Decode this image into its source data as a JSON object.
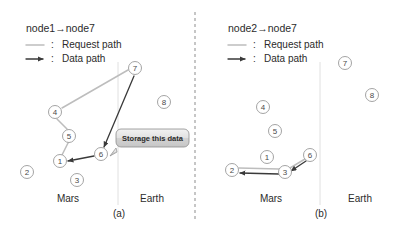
{
  "figure": {
    "caption_a": "(a)",
    "caption_b": "(b)"
  },
  "panel_a": {
    "title": "node1→node7",
    "legend": [
      {
        "colon": ":",
        "label": "Request path",
        "kind": "request",
        "color": "#bdbdbd"
      },
      {
        "colon": ":",
        "label": "Data path",
        "kind": "data",
        "color": "#3a3a3a"
      }
    ],
    "regions": {
      "left": "Mars",
      "right": "Earth"
    },
    "nodes": [
      {
        "id": "n7",
        "label": "7",
        "x": 135,
        "y": 68
      },
      {
        "id": "n8",
        "label": "8",
        "x": 164,
        "y": 102
      },
      {
        "id": "n4",
        "label": "4",
        "x": 55,
        "y": 112
      },
      {
        "id": "n5",
        "label": "5",
        "x": 69,
        "y": 136
      },
      {
        "id": "n6",
        "label": "6",
        "x": 101,
        "y": 154
      },
      {
        "id": "n1",
        "label": "1",
        "x": 60,
        "y": 161
      },
      {
        "id": "n2",
        "label": "2",
        "x": 27,
        "y": 172
      },
      {
        "id": "n3",
        "label": "3",
        "x": 77,
        "y": 180
      }
    ],
    "request_path": [
      "n1",
      "n5",
      "n4",
      "n7"
    ],
    "data_path": [
      "n7",
      "n6",
      "n1"
    ],
    "callout": {
      "text": "Storage this data",
      "x": 124,
      "y": 134,
      "w": 66,
      "h": 17
    }
  },
  "panel_b": {
    "title": "node2→node7",
    "legend": [
      {
        "colon": ":",
        "label": "Request path",
        "kind": "request",
        "color": "#bdbdbd"
      },
      {
        "colon": ":",
        "label": "Data path",
        "kind": "data",
        "color": "#3a3a3a"
      }
    ],
    "regions": {
      "left": "Mars",
      "right": "Earth"
    },
    "nodes": [
      {
        "id": "n7",
        "label": "7",
        "x": 345,
        "y": 63
      },
      {
        "id": "n8",
        "label": "8",
        "x": 372,
        "y": 95
      },
      {
        "id": "n4",
        "label": "4",
        "x": 263,
        "y": 107
      },
      {
        "id": "n5",
        "label": "5",
        "x": 275,
        "y": 131
      },
      {
        "id": "n1",
        "label": "1",
        "x": 267,
        "y": 157
      },
      {
        "id": "n6",
        "label": "6",
        "x": 310,
        "y": 155
      },
      {
        "id": "n2",
        "label": "2",
        "x": 232,
        "y": 170
      },
      {
        "id": "n3",
        "label": "3",
        "x": 285,
        "y": 172
      }
    ],
    "request_path": [
      "n2",
      "n3",
      "n6"
    ],
    "data_path": [
      "n6",
      "n3",
      "n2"
    ]
  },
  "colors": {
    "request": "#bdbdbd",
    "data": "#3a3a3a",
    "node_stroke": "#9a9a9a",
    "divider": "#8d8d8d",
    "boundary": "#dcdcdc",
    "text": "#2b2b2b"
  }
}
